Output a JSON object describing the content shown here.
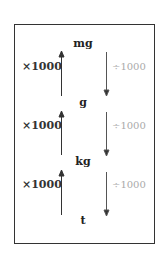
{
  "units": [
    "mg",
    "g",
    "kg",
    "t"
  ],
  "multiply_label": "×1000",
  "divide_label": "÷1000",
  "colors": {
    "multiply": "#333333",
    "divide": "#aaaaaa",
    "border": "#333333"
  }
}
